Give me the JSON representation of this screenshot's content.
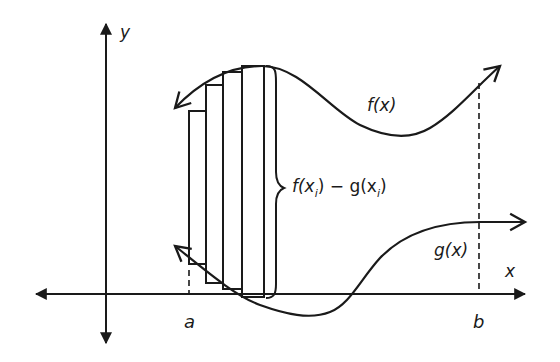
{
  "diagram": {
    "axes": {
      "x_label": "x",
      "y_label": "y"
    },
    "curves": {
      "upper": {
        "label": "f(x)"
      },
      "lower": {
        "label": "g(x)"
      }
    },
    "bounds": {
      "left": "a",
      "right": "b"
    },
    "brace_label": {
      "f": "f(x",
      "f_sub": "i",
      "mid": ") − g(x",
      "g_sub": "i",
      "end": ")"
    },
    "rectangle_count": 4,
    "colors": {
      "stroke": "#1a1a1a",
      "background": "#ffffff"
    }
  }
}
